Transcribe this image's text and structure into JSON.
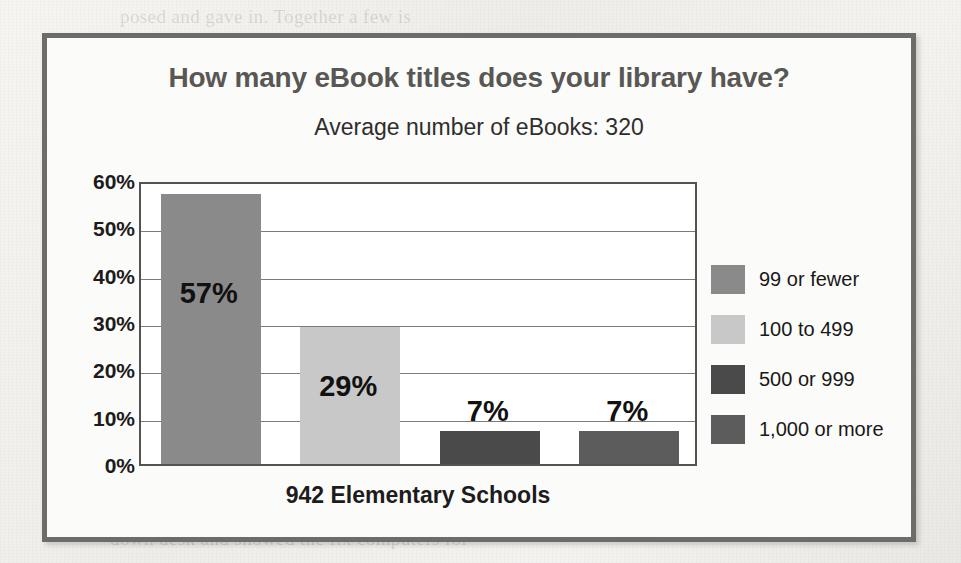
{
  "page": {
    "background_color": "#f2f1ee",
    "frame_border_color": "#6e6c68",
    "frame_background": "#fbfbfa"
  },
  "bleed_through_text": [
    {
      "text": "posed and gave in. Together a few is",
      "x": 120,
      "y": 6
    },
    {
      "text": "and no of Title. The library has",
      "x": 150,
      "y": 150
    },
    {
      "text": "not to and a",
      "x": 150,
      "y": 188
    },
    {
      "text": "the students need all of",
      "x": 560,
      "y": 150
    },
    {
      "text": "the programs",
      "x": 560,
      "y": 196
    },
    {
      "text": "size per annual month called. My Wall is the way",
      "x": 90,
      "y": 498
    },
    {
      "text": "down desk and showed the fix computers for",
      "x": 110,
      "y": 528
    },
    {
      "text": "to have",
      "x": 640,
      "y": 470
    }
  ],
  "chart_data": {
    "type": "bar",
    "title": "How many eBook titles does your library have?",
    "subtitle": "Average number of eBooks: 320",
    "xlabel": "942 Elementary Schools",
    "ylabel": "",
    "ylim": [
      0,
      60
    ],
    "grid": true,
    "legend_position": "right",
    "y_ticks": [
      "0%",
      "10%",
      "20%",
      "30%",
      "40%",
      "50%",
      "60%"
    ],
    "y_tick_values": [
      0,
      10,
      20,
      30,
      40,
      50,
      60
    ],
    "categories": [
      "99 or fewer",
      "100 to 499",
      "500 or 999",
      "1,000 or more"
    ],
    "values": [
      57,
      29,
      7,
      7
    ],
    "data_labels": [
      "57%",
      "29%",
      "7%",
      "7%"
    ],
    "colors": [
      "#8a8a8a",
      "#c8c8c8",
      "#4a4a4a",
      "#5c5c5c"
    ]
  },
  "legend": {
    "items": [
      {
        "label": "99 or fewer",
        "color": "#8a8a8a"
      },
      {
        "label": "100 to 499",
        "color": "#c8c8c8"
      },
      {
        "label": "500 or 999",
        "color": "#4a4a4a"
      },
      {
        "label": "1,000 or more",
        "color": "#5c5c5c"
      }
    ]
  }
}
